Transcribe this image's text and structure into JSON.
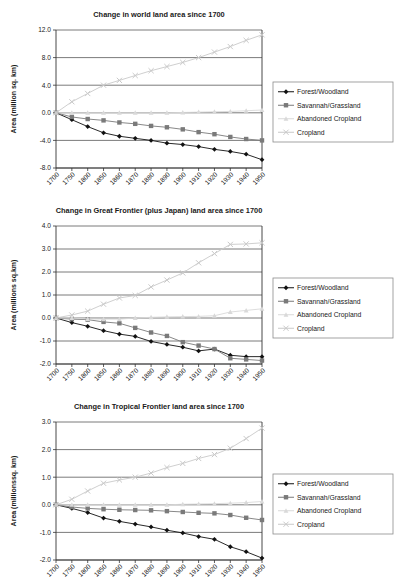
{
  "figure": {
    "series_names": [
      "Forest/Woodland",
      "Savannah/Grassland",
      "Abandoned Cropland",
      "Cropland"
    ],
    "series_colors": [
      "#111111",
      "#7a7a7a",
      "#d9d9d9",
      "#c9c9c9"
    ],
    "marker_shapes": [
      "diamond",
      "square",
      "triangle",
      "cross"
    ],
    "legend_position": "right"
  },
  "chart_data": [
    {
      "type": "line",
      "title": "Change in world land area since 1700",
      "xlabel": "",
      "ylabel": "Area (million sq. km)",
      "ylim": [
        -8.0,
        12.0
      ],
      "yticks": [
        "-8.0",
        "-4.0",
        "0.0",
        "4.0",
        "8.0",
        "12.0"
      ],
      "ytick_values": [
        -8.0,
        -4.0,
        0.0,
        4.0,
        8.0,
        12.0
      ],
      "grid": true,
      "legend": [
        "Forest/Woodland",
        "Savannah/Grassland",
        "Abandoned Cropland",
        "Cropland"
      ],
      "categories": [
        "1700",
        "1750",
        "1800",
        "1850",
        "1860",
        "1870",
        "1880",
        "1890",
        "1900",
        "1910",
        "1920",
        "1930",
        "1940",
        "1950"
      ],
      "series": [
        {
          "name": "Forest/Woodland",
          "values": [
            0.0,
            -1.0,
            -2.0,
            -2.9,
            -3.4,
            -3.7,
            -4.0,
            -4.4,
            -4.6,
            -4.9,
            -5.3,
            -5.6,
            -6.0,
            -6.8
          ]
        },
        {
          "name": "Savannah/Grassland",
          "values": [
            0.0,
            -0.6,
            -0.9,
            -1.1,
            -1.4,
            -1.6,
            -1.9,
            -2.1,
            -2.4,
            -2.8,
            -3.1,
            -3.5,
            -3.8,
            -4.0
          ]
        },
        {
          "name": "Abandoned Cropland",
          "values": [
            0.0,
            0.0,
            0.0,
            0.0,
            0.0,
            0.0,
            0.0,
            0.0,
            0.05,
            0.1,
            0.15,
            0.2,
            0.3,
            0.4
          ]
        },
        {
          "name": "Cropland",
          "values": [
            0.0,
            1.6,
            2.8,
            4.0,
            4.7,
            5.4,
            6.1,
            6.7,
            7.3,
            8.0,
            8.8,
            9.6,
            10.5,
            11.3
          ]
        }
      ]
    },
    {
      "type": "line",
      "title": "Change in Great Frontier (plus Japan) land area since 1700",
      "xlabel": "",
      "ylabel": "Area (millions sq.km)",
      "ylim": [
        -2.0,
        4.0
      ],
      "yticks": [
        "-2.0",
        "-1.0",
        "0.0",
        "1.0",
        "2.0",
        "3.0",
        "4.0"
      ],
      "ytick_values": [
        -2.0,
        -1.0,
        0.0,
        1.0,
        2.0,
        3.0,
        4.0
      ],
      "grid": true,
      "legend": [
        "Forest/Woodland",
        "Savannah/Grassland",
        "Abandoned Cropland",
        "Cropland"
      ],
      "categories": [
        "1700",
        "1750",
        "1800",
        "1850",
        "1860",
        "1870",
        "1880",
        "1890",
        "1900",
        "1910",
        "1920",
        "1930",
        "1940",
        "1950"
      ],
      "series": [
        {
          "name": "Forest/Woodland",
          "values": [
            0.0,
            -0.2,
            -0.36,
            -0.55,
            -0.7,
            -0.8,
            -1.02,
            -1.15,
            -1.27,
            -1.43,
            -1.35,
            -1.62,
            -1.68,
            -1.68
          ]
        },
        {
          "name": "Savannah/Grassland",
          "values": [
            0.0,
            -0.05,
            -0.07,
            -0.17,
            -0.23,
            -0.43,
            -0.63,
            -0.78,
            -1.05,
            -1.2,
            -1.35,
            -1.75,
            -1.8,
            -1.85
          ]
        },
        {
          "name": "Abandoned Cropland",
          "values": [
            0.0,
            0.0,
            -0.04,
            -0.05,
            -0.05,
            0.0,
            0.03,
            0.05,
            0.06,
            0.07,
            0.1,
            0.26,
            0.33,
            0.4
          ]
        },
        {
          "name": "Cropland",
          "values": [
            0.0,
            0.13,
            0.3,
            0.6,
            0.87,
            0.98,
            1.35,
            1.65,
            1.96,
            2.4,
            2.8,
            3.2,
            3.22,
            3.27
          ]
        }
      ]
    },
    {
      "type": "line",
      "title": "Change in Tropical Frontier land area since 1700",
      "xlabel": "",
      "ylabel": "Area (millionssq. km)",
      "ylim": [
        -2.0,
        3.0
      ],
      "yticks": [
        "-2.0",
        "-1.0",
        "0.0",
        "1.0",
        "2.0",
        "3.0"
      ],
      "ytick_values": [
        -2.0,
        -1.0,
        0.0,
        1.0,
        2.0,
        3.0
      ],
      "grid": true,
      "legend": [
        "Forest/Woodland",
        "Savannah/Grassland",
        "Abandoned Cropland",
        "Cropland"
      ],
      "categories": [
        "1700",
        "1750",
        "1800",
        "1850",
        "1860",
        "1870",
        "1880",
        "1890",
        "1900",
        "1910",
        "1920",
        "1930",
        "1940",
        "1950"
      ],
      "series": [
        {
          "name": "Forest/Woodland",
          "values": [
            0.0,
            -0.13,
            -0.28,
            -0.48,
            -0.6,
            -0.7,
            -0.8,
            -0.92,
            -1.02,
            -1.15,
            -1.25,
            -1.52,
            -1.7,
            -1.93
          ]
        },
        {
          "name": "Savannah/Grassland",
          "values": [
            0.0,
            -0.08,
            -0.13,
            -0.16,
            -0.18,
            -0.19,
            -0.2,
            -0.23,
            -0.26,
            -0.29,
            -0.31,
            -0.37,
            -0.47,
            -0.55
          ]
        },
        {
          "name": "Abandoned Cropland",
          "values": [
            0.0,
            0.0,
            0.0,
            0.0,
            0.0,
            0.0,
            0.0,
            0.0,
            0.02,
            0.03,
            0.04,
            0.06,
            0.08,
            0.12
          ]
        },
        {
          "name": "Cropland",
          "values": [
            0.0,
            0.2,
            0.5,
            0.78,
            0.9,
            1.0,
            1.15,
            1.35,
            1.5,
            1.68,
            1.82,
            2.05,
            2.4,
            2.78
          ]
        }
      ]
    }
  ]
}
